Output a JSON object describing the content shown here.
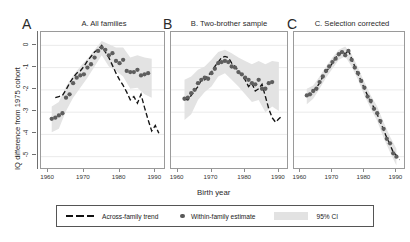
{
  "figure": {
    "ylabel": "IQ difference from 1975 cohort",
    "xlabel": "Birth year",
    "panel_letters": [
      "A",
      "B",
      "C"
    ]
  },
  "legend": {
    "items": [
      {
        "marker": "dashed-line",
        "label": "Across-family trend"
      },
      {
        "marker": "dot",
        "label": "Within-family estimate"
      },
      {
        "marker": "band",
        "label": "95% CI"
      }
    ]
  },
  "chart_data": {
    "type": "line",
    "title": "",
    "xlabel": "Birth year",
    "ylabel": "IQ difference from 1975 cohort",
    "xlim": [
      1958,
      1993
    ],
    "ylim": [
      -5.6,
      0.6
    ],
    "xticks": [
      1960,
      1970,
      1980,
      1990
    ],
    "yticks": [
      0,
      -1,
      -2,
      -3,
      -4,
      -5
    ],
    "ytick_labels": [
      "0",
      "-1",
      "-2",
      "-3",
      "-4",
      "-5"
    ],
    "xtick_labels": [
      "1960",
      "1970",
      "1980",
      "1990"
    ],
    "grid": "horizontal",
    "legend_position": "below",
    "panels": [
      {
        "key": "A",
        "title": "A. All families",
        "series": [
          {
            "name": "Across-family trend",
            "type": "line",
            "style": "dashed",
            "x": [
              1962,
              1963,
              1964,
              1965,
              1966,
              1967,
              1968,
              1969,
              1970,
              1971,
              1972,
              1973,
              1974,
              1975,
              1976,
              1977,
              1978,
              1979,
              1980,
              1981,
              1982,
              1983,
              1984,
              1985,
              1986,
              1987,
              1988,
              1989,
              1990,
              1991
            ],
            "values": [
              -2.35,
              -2.3,
              -2.25,
              -2.0,
              -1.7,
              -1.45,
              -1.25,
              -1.15,
              -0.95,
              -0.7,
              -0.5,
              -0.3,
              -0.18,
              0.0,
              -0.3,
              -0.55,
              -0.9,
              -1.25,
              -1.55,
              -1.8,
              -2.1,
              -2.45,
              -2.3,
              -2.6,
              -2.2,
              -2.8,
              -3.35,
              -3.85,
              -3.6,
              -3.95
            ]
          },
          {
            "name": "Within-family estimate",
            "type": "scatter",
            "x": [
              1961,
              1962,
              1963,
              1964,
              1965,
              1966,
              1967,
              1968,
              1969,
              1970,
              1971,
              1972,
              1973,
              1974,
              1975,
              1976,
              1977,
              1978,
              1979,
              1980,
              1981,
              1982,
              1983,
              1984,
              1985,
              1986,
              1987,
              1988
            ],
            "values": [
              -3.3,
              -3.25,
              -3.15,
              -3.05,
              -2.35,
              -2.2,
              -1.7,
              -1.45,
              -1.35,
              -1.3,
              -1.0,
              -0.85,
              -0.55,
              -0.25,
              -0.1,
              -0.2,
              -0.45,
              -0.35,
              -0.7,
              -0.8,
              -0.65,
              -1.15,
              -1.2,
              -1.2,
              -1.1,
              -1.35,
              -1.3,
              -1.25
            ]
          },
          {
            "name": "95% CI",
            "type": "band",
            "x": [
              1961,
              1963,
              1965,
              1967,
              1969,
              1971,
              1973,
              1975,
              1977,
              1979,
              1981,
              1983,
              1985,
              1987,
              1989
            ],
            "upper": [
              -2.75,
              -2.55,
              -1.85,
              -1.35,
              -0.95,
              -0.6,
              -0.2,
              0.2,
              0.05,
              -0.1,
              -0.1,
              -0.55,
              -0.45,
              -0.55,
              -0.6
            ],
            "lower": [
              -3.9,
              -3.75,
              -2.95,
              -2.35,
              -1.9,
              -1.45,
              -0.95,
              -0.45,
              -0.95,
              -1.15,
              -1.4,
              -1.95,
              -1.9,
              -2.2,
              -2.35
            ]
          }
        ]
      },
      {
        "key": "B",
        "title": "B. Two-brother sample",
        "series": [
          {
            "name": "Across-family trend",
            "type": "line",
            "style": "dashed",
            "x": [
              1962,
              1963,
              1964,
              1965,
              1966,
              1967,
              1968,
              1969,
              1970,
              1971,
              1972,
              1973,
              1974,
              1975,
              1976,
              1977,
              1978,
              1979,
              1980,
              1981,
              1982,
              1983,
              1984,
              1985,
              1986,
              1987,
              1988,
              1989,
              1990,
              1991
            ],
            "values": [
              -2.4,
              -2.45,
              -2.25,
              -2.05,
              -1.85,
              -1.55,
              -1.55,
              -1.35,
              -1.2,
              -0.95,
              -0.75,
              -0.55,
              -0.5,
              -0.55,
              -0.8,
              -0.95,
              -1.15,
              -1.35,
              -1.55,
              -1.85,
              -1.7,
              -2.05,
              -1.95,
              -1.75,
              -2.3,
              -2.85,
              -3.25,
              -3.45,
              -3.3,
              -3.15
            ]
          },
          {
            "name": "Within-family estimate",
            "type": "scatter",
            "x": [
              1962,
              1963,
              1964,
              1965,
              1966,
              1967,
              1968,
              1969,
              1970,
              1971,
              1972,
              1973,
              1974,
              1975,
              1976,
              1977,
              1978,
              1979,
              1980,
              1981,
              1982,
              1983,
              1984,
              1985,
              1986,
              1987,
              1988
            ],
            "values": [
              -2.4,
              -2.35,
              -2.15,
              -2.0,
              -1.7,
              -1.55,
              -1.45,
              -1.5,
              -1.25,
              -1.05,
              -0.8,
              -0.75,
              -0.7,
              -0.75,
              -0.95,
              -1.0,
              -1.2,
              -1.3,
              -1.45,
              -1.55,
              -1.7,
              -1.75,
              -1.55,
              -1.95,
              -1.95,
              -1.7,
              -1.65
            ]
          },
          {
            "name": "95% CI",
            "type": "band",
            "x": [
              1962,
              1964,
              1966,
              1968,
              1970,
              1972,
              1974,
              1976,
              1978,
              1980,
              1982,
              1984,
              1986,
              1988,
              1990
            ],
            "upper": [
              -1.55,
              -1.4,
              -1.1,
              -0.95,
              -0.65,
              -0.3,
              -0.2,
              -0.35,
              -0.55,
              -0.7,
              -0.85,
              -0.7,
              -0.85,
              -0.7,
              -0.75
            ],
            "lower": [
              -3.35,
              -3.1,
              -2.45,
              -2.1,
              -1.85,
              -1.4,
              -1.25,
              -1.55,
              -1.85,
              -2.2,
              -2.55,
              -2.45,
              -3.0,
              -2.75,
              -2.95
            ]
          }
        ]
      },
      {
        "key": "C",
        "title": "C. Selection corrected",
        "series": [
          {
            "name": "Across-family trend",
            "type": "line",
            "style": "dashed",
            "x": [
              1962,
              1963,
              1964,
              1965,
              1966,
              1967,
              1968,
              1969,
              1970,
              1971,
              1972,
              1973,
              1974,
              1975,
              1976,
              1977,
              1978,
              1979,
              1980,
              1981,
              1982,
              1983,
              1984,
              1985,
              1986,
              1987,
              1988,
              1989,
              1990,
              1991
            ],
            "values": [
              -2.3,
              -2.15,
              -2.05,
              -1.9,
              -1.7,
              -1.4,
              -1.2,
              -1.0,
              -0.8,
              -0.55,
              -0.45,
              -0.25,
              -0.4,
              -0.2,
              -0.6,
              -0.95,
              -1.3,
              -1.6,
              -1.95,
              -2.25,
              -2.55,
              -2.8,
              -3.1,
              -3.45,
              -3.8,
              -4.15,
              -4.45,
              -4.8,
              -4.95,
              -5.15
            ]
          },
          {
            "name": "Within-family estimate",
            "type": "scatter",
            "x": [
              1962,
              1963,
              1964,
              1965,
              1966,
              1967,
              1968,
              1969,
              1970,
              1971,
              1972,
              1973,
              1974,
              1975,
              1976,
              1977,
              1978,
              1979,
              1980,
              1981,
              1982,
              1983,
              1984,
              1985,
              1986,
              1987,
              1988,
              1989,
              1990
            ],
            "values": [
              -2.25,
              -2.2,
              -2.05,
              -1.95,
              -1.65,
              -1.4,
              -1.15,
              -0.95,
              -0.75,
              -0.6,
              -0.4,
              -0.3,
              -0.45,
              -0.25,
              -0.65,
              -1.0,
              -1.25,
              -1.6,
              -1.9,
              -2.3,
              -2.5,
              -2.85,
              -3.05,
              -3.4,
              -3.75,
              -4.2,
              -4.4,
              -4.85,
              -5.0
            ]
          },
          {
            "name": "95% CI",
            "type": "band",
            "x": [
              1962,
              1964,
              1966,
              1968,
              1970,
              1972,
              1974,
              1976,
              1978,
              1980,
              1982,
              1984,
              1986,
              1988,
              1990
            ],
            "upper": [
              -1.95,
              -1.8,
              -1.4,
              -0.95,
              -0.55,
              -0.2,
              -0.05,
              -0.4,
              -1.0,
              -1.65,
              -2.25,
              -2.75,
              -3.45,
              -4.1,
              -4.65
            ],
            "lower": [
              -2.65,
              -2.4,
              -1.95,
              -1.45,
              -1.05,
              -0.65,
              -0.5,
              -0.95,
              -1.55,
              -2.25,
              -2.85,
              -3.4,
              -4.15,
              -4.8,
              -5.4
            ]
          }
        ]
      }
    ]
  }
}
